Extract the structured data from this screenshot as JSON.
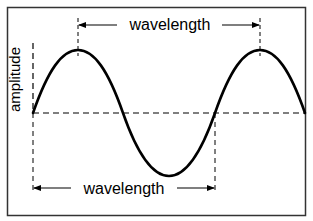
{
  "diagram": {
    "labels": {
      "top_wavelength": "wavelength",
      "bottom_wavelength": "wavelength",
      "amplitude": "amplitude"
    },
    "colors": {
      "line": "#000000",
      "border": "#333333",
      "background": "#ffffff"
    }
  }
}
